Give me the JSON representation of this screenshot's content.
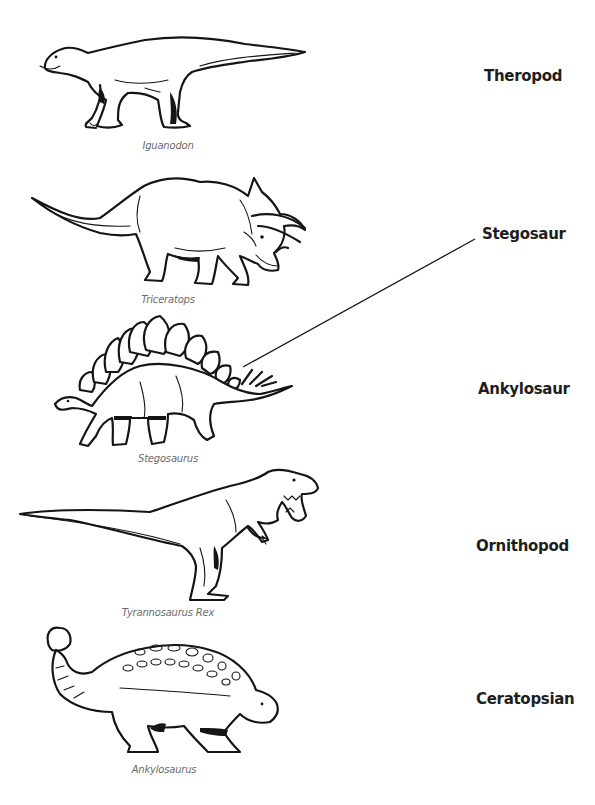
{
  "worksheet": {
    "dinosaurs": [
      {
        "caption": "Iguanodon",
        "illustration": "iguanodon-illustration"
      },
      {
        "caption": "Triceratops",
        "illustration": "triceratops-illustration"
      },
      {
        "caption": "Stegosaurus",
        "illustration": "stegosaurus-illustration"
      },
      {
        "caption": "Tyrannosaurus Rex",
        "illustration": "tyrannosaurus-rex-illustration"
      },
      {
        "caption": "Ankylosaurus",
        "illustration": "ankylosaurus-illustration"
      }
    ],
    "groups": [
      {
        "label": "Theropod"
      },
      {
        "label": "Stegosaur"
      },
      {
        "label": "Ankylosaur"
      },
      {
        "label": "Ornithopod"
      },
      {
        "label": "Ceratopsian"
      }
    ],
    "matches": [
      {
        "from": "Stegosaurus",
        "to": "Stegosaur"
      }
    ],
    "colors": {
      "ink": "#151515",
      "caption": "#6b6b6b",
      "label": "#1e1e1e",
      "background": "#ffffff"
    }
  }
}
